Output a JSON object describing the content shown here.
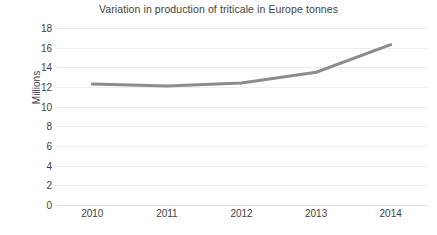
{
  "chart_data": {
    "type": "line",
    "title": "Variation in production of triticale in Europe tonnes",
    "xlabel": "",
    "ylabel": "Millions",
    "categories": [
      "2010",
      "2011",
      "2012",
      "2013",
      "2014"
    ],
    "x": [
      2010,
      2011,
      2012,
      2013,
      2014
    ],
    "series": [
      {
        "name": "Triticale production",
        "values": [
          12.3,
          12.1,
          12.4,
          13.5,
          16.3
        ],
        "color": "#8c8c8c",
        "line_width": 3,
        "markers": false
      }
    ],
    "ylim": [
      0,
      18
    ],
    "ytick_step": 2,
    "yticks": [
      18,
      16,
      14,
      12,
      10,
      8,
      6,
      4,
      2,
      0
    ],
    "ytick_labels": [
      "18",
      "16",
      "14",
      "12",
      "10",
      "8",
      "6",
      "4",
      "2",
      "0"
    ],
    "grid": true,
    "grid_axis": "y",
    "grid_color": "#eeeeee",
    "legend": false,
    "legend_position": "none",
    "background": "#ffffff",
    "units": "Millions of tonnes"
  }
}
